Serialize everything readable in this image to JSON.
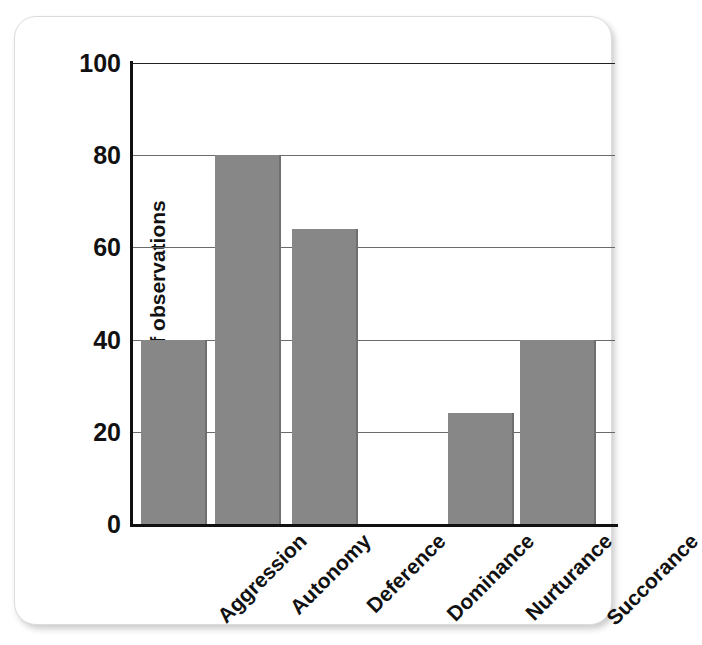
{
  "chart_data": {
    "type": "bar",
    "title": "",
    "xlabel": "",
    "ylabel": "Number of observations",
    "categories": [
      "Aggression",
      "Autonomy",
      "Deference",
      "Dominance",
      "Nurturance",
      "Succorance"
    ],
    "values": [
      40,
      80,
      64,
      0,
      24,
      40
    ],
    "ylim": [
      0,
      100
    ],
    "yticks": [
      0,
      20,
      40,
      60,
      80,
      100
    ],
    "ytick_labels": [
      "0",
      "20",
      "40",
      "60",
      "80",
      "100"
    ],
    "grid": "horizontal",
    "legend": "none",
    "bar_color": "#878787",
    "axis_color": "#111111",
    "grid_color": "#6b6b6b",
    "background": "#ffffff"
  }
}
